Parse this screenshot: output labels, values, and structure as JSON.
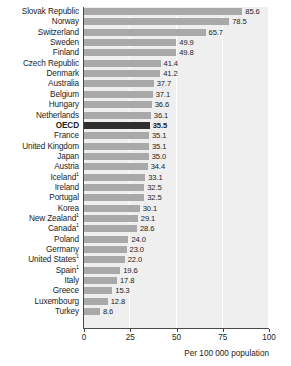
{
  "chart_data": {
    "type": "bar",
    "orientation": "horizontal",
    "title": "",
    "xlabel": "Per 100 000 population",
    "ylabel": "",
    "xlim": [
      0,
      100
    ],
    "xticks": [
      0,
      25,
      50,
      75,
      100
    ],
    "grid": true,
    "legend": null,
    "highlight_category": "OECD",
    "footnote_marker": "1",
    "categories": [
      "Slovak Republic",
      "Norway",
      "Switzerland",
      "Sweden",
      "Finland",
      "Czech Republic",
      "Denmark",
      "Australia",
      "Belgium",
      "Hungary",
      "Netherlands",
      "OECD",
      "France",
      "United Kingdom",
      "Japan",
      "Austria",
      "Iceland",
      "Ireland",
      "Portugal",
      "Korea",
      "New Zealand",
      "Canada",
      "Poland",
      "Germany",
      "United States",
      "Spain",
      "Italy",
      "Greece",
      "Luxembourg",
      "Turkey"
    ],
    "values": [
      85.6,
      78.5,
      65.7,
      49.9,
      49.8,
      41.4,
      41.2,
      37.7,
      37.1,
      36.6,
      36.1,
      35.5,
      35.1,
      35.1,
      35.0,
      34.4,
      33.1,
      32.5,
      32.5,
      30.1,
      29.1,
      28.6,
      24.0,
      23.0,
      22.0,
      19.6,
      17.8,
      15.3,
      12.8,
      8.6
    ],
    "rows": [
      {
        "label": "Slovak Republic",
        "value": 85.6,
        "value_text": "85.6",
        "sup": "",
        "highlight": false
      },
      {
        "label": "Norway",
        "value": 78.5,
        "value_text": "78.5",
        "sup": "",
        "highlight": false
      },
      {
        "label": "Switzerland",
        "value": 65.7,
        "value_text": "65.7",
        "sup": "",
        "highlight": false
      },
      {
        "label": "Sweden",
        "value": 49.9,
        "value_text": "49.9",
        "sup": "",
        "highlight": false
      },
      {
        "label": "Finland",
        "value": 49.8,
        "value_text": "49.8",
        "sup": "",
        "highlight": false
      },
      {
        "label": "Czech Republic",
        "value": 41.4,
        "value_text": "41.4",
        "sup": "",
        "highlight": false
      },
      {
        "label": "Denmark",
        "value": 41.2,
        "value_text": "41.2",
        "sup": "",
        "highlight": false
      },
      {
        "label": "Australia",
        "value": 37.7,
        "value_text": "37.7",
        "sup": "",
        "highlight": false
      },
      {
        "label": "Belgium",
        "value": 37.1,
        "value_text": "37.1",
        "sup": "",
        "highlight": false
      },
      {
        "label": "Hungary",
        "value": 36.6,
        "value_text": "36.6",
        "sup": "",
        "highlight": false
      },
      {
        "label": "Netherlands",
        "value": 36.1,
        "value_text": "36.1",
        "sup": "",
        "highlight": false
      },
      {
        "label": "OECD",
        "value": 35.5,
        "value_text": "35.5",
        "sup": "",
        "highlight": true
      },
      {
        "label": "France",
        "value": 35.1,
        "value_text": "35.1",
        "sup": "",
        "highlight": false
      },
      {
        "label": "United Kingdom",
        "value": 35.1,
        "value_text": "35.1",
        "sup": "",
        "highlight": false
      },
      {
        "label": "Japan",
        "value": 35.0,
        "value_text": "35.0",
        "sup": "",
        "highlight": false
      },
      {
        "label": "Austria",
        "value": 34.4,
        "value_text": "34.4",
        "sup": "",
        "highlight": false
      },
      {
        "label": "Iceland",
        "value": 33.1,
        "value_text": "33.1",
        "sup": "1",
        "highlight": false
      },
      {
        "label": "Ireland",
        "value": 32.5,
        "value_text": "32.5",
        "sup": "",
        "highlight": false
      },
      {
        "label": "Portugal",
        "value": 32.5,
        "value_text": "32.5",
        "sup": "",
        "highlight": false
      },
      {
        "label": "Korea",
        "value": 30.1,
        "value_text": "30.1",
        "sup": "",
        "highlight": false
      },
      {
        "label": "New Zealand",
        "value": 29.1,
        "value_text": "29.1",
        "sup": "1",
        "highlight": false
      },
      {
        "label": "Canada",
        "value": 28.6,
        "value_text": "28.6",
        "sup": "1",
        "highlight": false
      },
      {
        "label": "Poland",
        "value": 24.0,
        "value_text": "24.0",
        "sup": "",
        "highlight": false
      },
      {
        "label": "Germany",
        "value": 23.0,
        "value_text": "23.0",
        "sup": "",
        "highlight": false
      },
      {
        "label": "United States",
        "value": 22.0,
        "value_text": "22.0",
        "sup": "1",
        "highlight": false
      },
      {
        "label": "Spain",
        "value": 19.6,
        "value_text": "19.6",
        "sup": "1",
        "highlight": false
      },
      {
        "label": "Italy",
        "value": 17.8,
        "value_text": "17.8",
        "sup": "",
        "highlight": false
      },
      {
        "label": "Greece",
        "value": 15.3,
        "value_text": "15.3",
        "sup": "",
        "highlight": false
      },
      {
        "label": "Luxembourg",
        "value": 12.8,
        "value_text": "12.8",
        "sup": "",
        "highlight": false
      },
      {
        "label": "Turkey",
        "value": 8.6,
        "value_text": "8.6",
        "sup": "",
        "highlight": false
      }
    ],
    "colors": {
      "bar": "#a9a9a9",
      "bar_highlight": "#2f2f2f",
      "plot_background": "#efefef",
      "gridline": "#ffffff",
      "axis": "#4a4a4a",
      "text": "#1c1c1c"
    }
  },
  "axis": {
    "tick_labels": [
      "0",
      "25",
      "50",
      "75",
      "100"
    ],
    "title": "Per 100 000 population"
  }
}
